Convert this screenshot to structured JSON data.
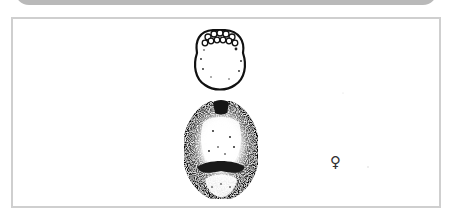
{
  "header_bar": {
    "color": "#b9b9b9"
  },
  "figure": {
    "border_color": "#cfcfcf",
    "sex_symbol": "♀",
    "sex_label": "female"
  }
}
